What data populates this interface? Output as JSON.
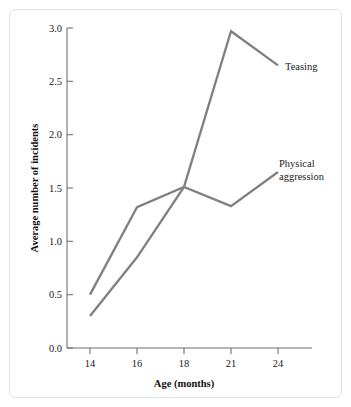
{
  "chart_data": {
    "type": "line",
    "title": "",
    "xlabel": "Age (months)",
    "ylabel": "Average number of incidents",
    "categories": [
      "14",
      "16",
      "18",
      "21",
      "24"
    ],
    "x_tick_labels": [
      "14",
      "16",
      "18",
      "21",
      "24"
    ],
    "y_tick_labels": [
      "0.0",
      "0.5",
      "1.0",
      "1.5",
      "2.0",
      "2.5",
      "3.0"
    ],
    "y_ticks": [
      0.0,
      0.5,
      1.0,
      1.5,
      2.0,
      2.5,
      3.0
    ],
    "ylim": [
      0.0,
      3.0
    ],
    "grid": false,
    "legend_position": "inline-right-annotations",
    "series": [
      {
        "name": "Teasing",
        "label": "Teasing",
        "color": "#808080",
        "values": [
          0.3,
          0.85,
          1.51,
          2.97,
          2.65
        ]
      },
      {
        "name": "Physical aggression",
        "label": "Physical aggression",
        "label_line1": "Physical",
        "label_line2": "aggression",
        "color": "#808080",
        "values": [
          0.5,
          1.32,
          1.51,
          1.33,
          1.65
        ]
      }
    ],
    "annotations": [
      {
        "text": "Teasing",
        "series": "Teasing",
        "at_x": "24"
      },
      {
        "text": "Physical aggression",
        "series": "Physical aggression",
        "at_x": "24"
      }
    ]
  },
  "colors": {
    "line": "#808080",
    "axis": "#6f6f6f",
    "text": "#1a1a1a",
    "frame_border": "#e3e3e3",
    "background": "#ffffff"
  }
}
